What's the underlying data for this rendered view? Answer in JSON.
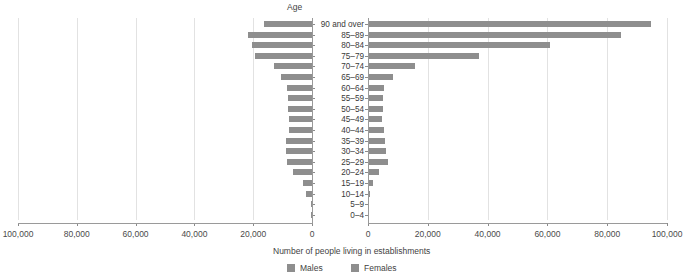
{
  "chart_data": {
    "type": "bar",
    "subtype": "population-pyramid",
    "title": "",
    "axis_group_title": "Age",
    "xlabel": "Number of people living in establishments",
    "ylabel": "Age",
    "categories": [
      "90 and over",
      "85–89",
      "80–84",
      "75–79",
      "70–74",
      "65–69",
      "60–64",
      "55–59",
      "50–54",
      "45–49",
      "40–44",
      "35–39",
      "30–34",
      "25–29",
      "20–24",
      "15–19",
      "10–14",
      "5–9",
      "0–4"
    ],
    "series": [
      {
        "name": "Males",
        "side": "left",
        "color": "#8e8e8e",
        "values": [
          16300,
          21700,
          20400,
          19400,
          13000,
          10600,
          8500,
          8200,
          8300,
          7800,
          7900,
          9000,
          8800,
          8600,
          6400,
          2900,
          1900,
          400,
          300
        ]
      },
      {
        "name": "Females",
        "side": "right",
        "color": "#8e8e8e",
        "values": [
          94500,
          84500,
          61000,
          37000,
          15800,
          8200,
          5200,
          4900,
          5000,
          4700,
          5200,
          5600,
          6100,
          6600,
          3800,
          1700,
          600,
          300,
          200
        ]
      }
    ],
    "left_axis": {
      "ticks": [
        "100,000",
        "80,000",
        "60,000",
        "40,000",
        "20,000",
        "0"
      ],
      "values": [
        100000,
        80000,
        60000,
        40000,
        20000,
        0
      ],
      "max": 100000
    },
    "right_axis": {
      "ticks": [
        "0",
        "20,000",
        "40,000",
        "60,000",
        "80,000",
        "100,000"
      ],
      "values": [
        0,
        20000,
        40000,
        60000,
        80000,
        100000
      ],
      "max": 100000
    },
    "legend": {
      "position": "bottom-center",
      "entries": [
        "Males",
        "Females"
      ]
    },
    "grid": true
  },
  "legend": {
    "males_label": "Males",
    "females_label": "Females"
  },
  "labels": {
    "age_title": "Age",
    "x_axis_title": "Number of people living in establishments"
  }
}
